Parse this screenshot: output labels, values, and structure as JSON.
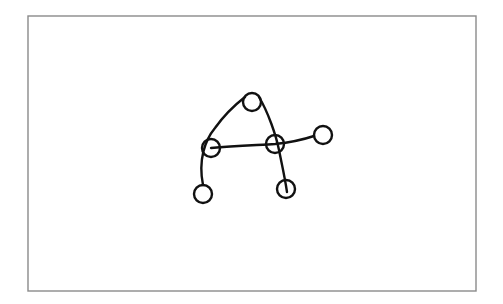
{
  "diagram": {
    "type": "sketch-graph",
    "frame": {
      "x": 28,
      "y": 16,
      "width": 448,
      "height": 275,
      "color": "#8a8a8a"
    },
    "stroke_color": "#111111",
    "nodes": [
      {
        "id": "n-top",
        "cx": 252,
        "cy": 102,
        "r": 9
      },
      {
        "id": "n-left-mid",
        "cx": 211,
        "cy": 148,
        "r": 9
      },
      {
        "id": "n-right-mid",
        "cx": 275,
        "cy": 144,
        "r": 9
      },
      {
        "id": "n-far-right",
        "cx": 323,
        "cy": 135,
        "r": 9
      },
      {
        "id": "n-bottom-left",
        "cx": 203,
        "cy": 194,
        "r": 9
      },
      {
        "id": "n-bottom-right",
        "cx": 286,
        "cy": 189,
        "r": 9
      }
    ],
    "edges": [
      {
        "id": "e-left-arc",
        "path": "M 203 185 C 198 160, 205 140, 215 128 C 225 114, 236 104, 245 97"
      },
      {
        "id": "e-right-leg",
        "path": "M 259 97 C 268 112, 276 135, 279 150 C 282 165, 285 178, 287 192"
      },
      {
        "id": "e-crossbar",
        "path": "M 211 148 C 235 146, 260 145, 275 144 C 295 142, 308 138, 314 136"
      }
    ]
  }
}
